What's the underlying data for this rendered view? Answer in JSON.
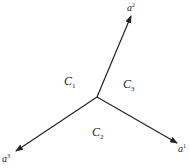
{
  "diagram": {
    "origin": {
      "x": 97,
      "y": 97
    },
    "vectors": [
      {
        "id": "a1",
        "base": "a",
        "sup": "1",
        "tip": {
          "x": 177,
          "y": 143
        },
        "label_pos": {
          "x": 178,
          "y": 150
        }
      },
      {
        "id": "a2",
        "base": "a",
        "sup": "2",
        "tip": {
          "x": 131,
          "y": 16
        },
        "label_pos": {
          "x": 127,
          "y": 11
        }
      },
      {
        "id": "a3",
        "base": "a",
        "sup": "3",
        "tip": {
          "x": 16,
          "y": 151
        },
        "label_pos": {
          "x": 2,
          "y": 160
        }
      }
    ],
    "regions": [
      {
        "id": "C1",
        "base": "C",
        "sub": "1",
        "pos": {
          "x": 66,
          "y": 83
        }
      },
      {
        "id": "C3",
        "base": "C",
        "sub": "3",
        "pos": {
          "x": 124,
          "y": 87
        }
      },
      {
        "id": "C2",
        "base": "C",
        "sub": "2",
        "pos": {
          "x": 93,
          "y": 135
        }
      }
    ],
    "colors": {
      "line": "#222222",
      "text": "#222222",
      "background": "#ffffff"
    }
  }
}
